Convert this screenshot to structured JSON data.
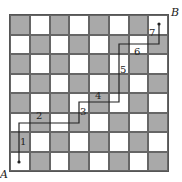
{
  "diagram": {
    "type": "checkerboard-path",
    "rows": 8,
    "cols": 8,
    "top_left_color": "dark",
    "colors": {
      "dark": "#a9a9a9",
      "light": "#ffffff",
      "line": "#222222"
    },
    "corner_labels": {
      "start": "A",
      "end": "B"
    },
    "path_points": [
      [
        19,
        162
      ],
      [
        19,
        123
      ],
      [
        79,
        123
      ],
      [
        79,
        102
      ],
      [
        119,
        102
      ],
      [
        119,
        44
      ],
      [
        159,
        44
      ],
      [
        159,
        24
      ]
    ],
    "segment_labels": [
      {
        "text": "1",
        "x": 20,
        "y": 136
      },
      {
        "text": "2",
        "x": 36,
        "y": 110
      },
      {
        "text": "3",
        "x": 80,
        "y": 106
      },
      {
        "text": "4",
        "x": 95,
        "y": 90
      },
      {
        "text": "5",
        "x": 120,
        "y": 64
      },
      {
        "text": "6",
        "x": 134,
        "y": 46
      },
      {
        "text": "7",
        "x": 149,
        "y": 27
      }
    ]
  }
}
